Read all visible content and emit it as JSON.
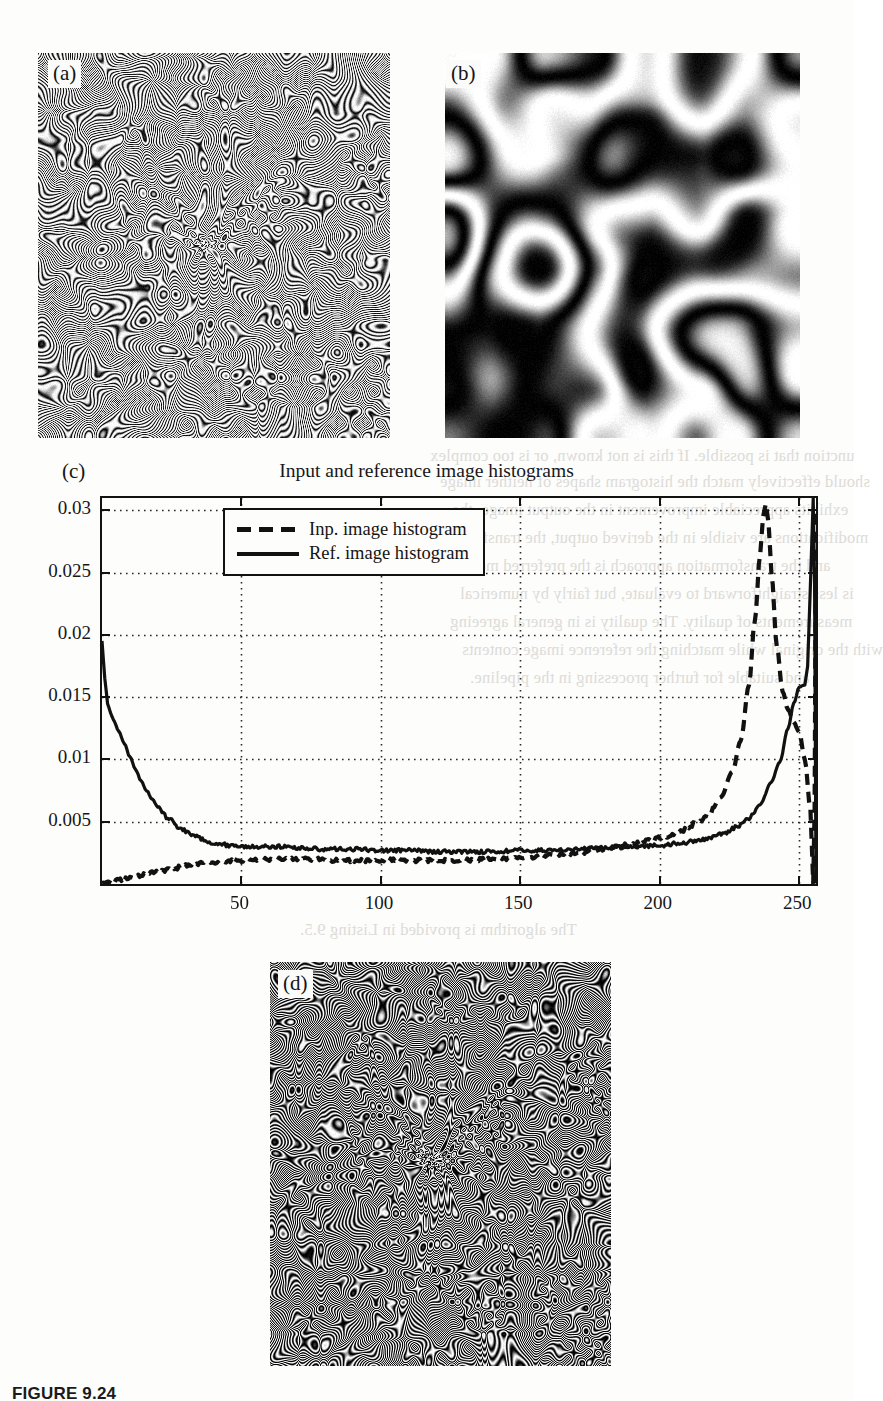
{
  "page": {
    "caption": "FIGURE 9.24",
    "background_showthrough": [
      "unction that is possible. If this is not known, or is too complex",
      "should effectively match the histogram shapes of neither image",
      "exhibits appreciable improvement in the output image, the",
      "modifications are visible in the derived output, the transform",
      "and the transformation approach is the preferred method",
      "is less straightforward to evaluate, but fairly by numerical",
      "measurements of quality. The quality is in general agreeing",
      "with the original while matching the reference image contents",
      "and suitable for further processing in the pipeline.",
      "The algorithm is provided in Listing 9.5."
    ]
  },
  "panels": [
    {
      "id": "a",
      "label": "(a)",
      "kind": "image",
      "description": "concentric-ring fringe pattern"
    },
    {
      "id": "b",
      "label": "(b)",
      "kind": "image",
      "description": "low frequency blob pattern"
    },
    {
      "id": "c",
      "label": "(c)",
      "kind": "chart"
    },
    {
      "id": "d",
      "label": "(d)",
      "kind": "image",
      "description": "matched concentric-ring fringe pattern"
    }
  ],
  "chart_data": {
    "type": "line",
    "title": "Input and reference image histograms",
    "xlabel": "",
    "ylabel": "",
    "xlim": [
      0,
      256
    ],
    "ylim": [
      0,
      0.031
    ],
    "grid": true,
    "grid_style": "dotted",
    "legend_position": "upper center",
    "xticks": [
      50,
      100,
      150,
      200,
      250
    ],
    "yticks": [
      0.005,
      0.01,
      0.015,
      0.02,
      0.025,
      0.03
    ],
    "ytick_labels": [
      "0.005",
      "0.01",
      "0.015",
      "0.02",
      "0.025",
      "0.03"
    ],
    "xtick_labels": [
      "50",
      "100",
      "150",
      "200",
      "250"
    ],
    "series": [
      {
        "name": "Inp. image histogram",
        "style": "dashed",
        "color": "#111111",
        "x": [
          0,
          4,
          8,
          12,
          16,
          20,
          26,
          32,
          38,
          44,
          50,
          58,
          66,
          74,
          82,
          90,
          100,
          110,
          120,
          130,
          140,
          150,
          160,
          170,
          180,
          190,
          196,
          202,
          208,
          214,
          218,
          222,
          226,
          229,
          232,
          234,
          236,
          237,
          238,
          239,
          240,
          242,
          244,
          246,
          248,
          250,
          252,
          254,
          255
        ],
        "y": [
          0.0,
          0.0002,
          0.0004,
          0.0006,
          0.0008,
          0.001,
          0.0013,
          0.0015,
          0.0017,
          0.0018,
          0.0019,
          0.002,
          0.002,
          0.002,
          0.0019,
          0.0019,
          0.0019,
          0.0019,
          0.0019,
          0.0019,
          0.002,
          0.0021,
          0.0023,
          0.0025,
          0.0028,
          0.0032,
          0.0035,
          0.0038,
          0.0043,
          0.005,
          0.0058,
          0.007,
          0.009,
          0.0115,
          0.016,
          0.021,
          0.0265,
          0.0295,
          0.0305,
          0.029,
          0.025,
          0.019,
          0.0155,
          0.014,
          0.013,
          0.0122,
          0.01,
          0.006,
          0.0
        ]
      },
      {
        "name": "Ref. image histogram",
        "style": "solid",
        "color": "#111111",
        "x": [
          0,
          1,
          2,
          3,
          4,
          6,
          8,
          10,
          12,
          14,
          16,
          18,
          20,
          24,
          28,
          32,
          36,
          40,
          46,
          52,
          58,
          64,
          70,
          80,
          90,
          100,
          110,
          120,
          130,
          140,
          150,
          160,
          170,
          180,
          190,
          200,
          208,
          216,
          222,
          228,
          232,
          236,
          240,
          243,
          246,
          248,
          250,
          252,
          253,
          254,
          255
        ],
        "y": [
          0.0195,
          0.0165,
          0.0145,
          0.0138,
          0.0132,
          0.0123,
          0.0113,
          0.0102,
          0.0092,
          0.0083,
          0.0075,
          0.0068,
          0.0062,
          0.0052,
          0.0045,
          0.004,
          0.0036,
          0.0033,
          0.0031,
          0.003,
          0.003,
          0.003,
          0.0029,
          0.0028,
          0.0028,
          0.0027,
          0.0027,
          0.0026,
          0.0026,
          0.0026,
          0.0027,
          0.0027,
          0.0028,
          0.0029,
          0.003,
          0.0031,
          0.0033,
          0.0036,
          0.004,
          0.0046,
          0.0053,
          0.0064,
          0.0082,
          0.0098,
          0.0125,
          0.0145,
          0.0158,
          0.016,
          0.0175,
          0.024,
          0.031
        ]
      }
    ]
  },
  "legend": {
    "items": [
      {
        "label": "Inp. image histogram",
        "style": "dashed"
      },
      {
        "label": "Ref. image histogram",
        "style": "solid"
      }
    ]
  }
}
